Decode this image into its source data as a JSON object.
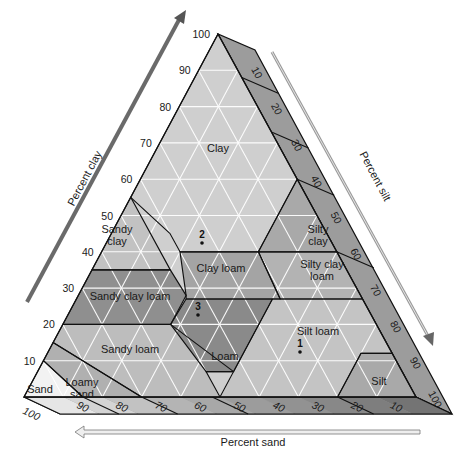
{
  "axes": {
    "clay": {
      "label": "Percent clay",
      "ticks": [
        "10",
        "20",
        "30",
        "40",
        "50",
        "60",
        "70",
        "80",
        "90",
        "100"
      ]
    },
    "silt": {
      "label": "Percent silt",
      "ticks": [
        "10",
        "20",
        "30",
        "40",
        "50",
        "60",
        "70",
        "80",
        "90",
        "100"
      ]
    },
    "sand": {
      "label": "Percent sand",
      "ticks": [
        "100",
        "90",
        "80",
        "70",
        "60",
        "50",
        "40",
        "30",
        "20",
        "10"
      ]
    }
  },
  "classes": [
    {
      "name": "Clay",
      "label_lines": [
        "Clay"
      ],
      "color": "#cfcfcf"
    },
    {
      "name": "Sandy clay",
      "label_lines": [
        "Sandy",
        "clay"
      ],
      "color": "#c2c2c2"
    },
    {
      "name": "Silty clay",
      "label_lines": [
        "Silty",
        "clay"
      ],
      "color": "#a9a9a9"
    },
    {
      "name": "Sandy clay loam",
      "label_lines": [
        "Sandy clay loam"
      ],
      "color": "#8f8f8f"
    },
    {
      "name": "Clay loam",
      "label_lines": [
        "Clay loam"
      ],
      "color": "#a4a4a4"
    },
    {
      "name": "Silty clay loam",
      "label_lines": [
        "Silty clay",
        "loam"
      ],
      "color": "#b3b3b3"
    },
    {
      "name": "Loam",
      "label_lines": [
        "Loam"
      ],
      "color": "#8a8a8a"
    },
    {
      "name": "Sandy loam",
      "label_lines": [
        "Sandy loam"
      ],
      "color": "#bdbdbd"
    },
    {
      "name": "Silt loam",
      "label_lines": [
        "Silt loam"
      ],
      "color": "#c4c4c4"
    },
    {
      "name": "Loamy sand",
      "label_lines": [
        "Loamy",
        "sand"
      ],
      "color": "#b0b0b0"
    },
    {
      "name": "Sand",
      "label_lines": [
        "Sand"
      ],
      "color": "#f2f2f2"
    },
    {
      "name": "Silt",
      "label_lines": [
        "Silt"
      ],
      "color": "#a9a9a9"
    }
  ],
  "points": [
    {
      "id": "1",
      "clay": 12,
      "silt": 65
    },
    {
      "id": "2",
      "clay": 42,
      "silt": 30
    },
    {
      "id": "3",
      "clay": 22,
      "silt": 35
    }
  ]
}
